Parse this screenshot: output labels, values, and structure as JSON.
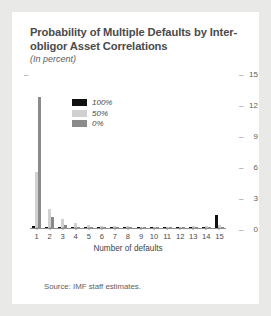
{
  "card": {
    "title": "Probability of Multiple Defaults by Inter-obligor Asset Correlations",
    "subtitle": "(In percent)",
    "source": "Source: IMF staff estimates."
  },
  "legend": {
    "items": [
      {
        "label": "100%",
        "color": "#111111"
      },
      {
        "label": "50%",
        "color": "#d0d0d0"
      },
      {
        "label": "0%",
        "color": "#8a8a8a"
      }
    ]
  },
  "axis": {
    "left_tick_label": "–",
    "y_ticks": [
      "15",
      "12",
      "9",
      "6",
      "3",
      "0"
    ]
  },
  "chart_data": {
    "type": "bar",
    "title": "Probability of Multiple Defaults by Inter-obligor Asset Correlations",
    "subtitle": "(In percent)",
    "xlabel": "Number of defaults",
    "ylabel": "",
    "ylim": [
      0,
      15
    ],
    "yticks": [
      0,
      3,
      6,
      9,
      12,
      15
    ],
    "grid": false,
    "legend_position": "upper-left-inside",
    "categories": [
      1,
      2,
      3,
      4,
      5,
      6,
      7,
      8,
      9,
      10,
      11,
      12,
      13,
      14,
      15
    ],
    "series": [
      {
        "name": "100%",
        "color": "#111111",
        "values": [
          0.15,
          0.12,
          0.1,
          0.08,
          0.08,
          0.07,
          0.07,
          0.07,
          0.07,
          0.07,
          0.08,
          0.08,
          0.1,
          0.12,
          1.3
        ]
      },
      {
        "name": "50%",
        "color": "#d0d0d0",
        "values": [
          5.5,
          1.9,
          0.85,
          0.45,
          0.3,
          0.22,
          0.18,
          0.15,
          0.14,
          0.13,
          0.13,
          0.14,
          0.16,
          0.2,
          0.3
        ]
      },
      {
        "name": "0%",
        "color": "#8a8a8a",
        "values": [
          12.8,
          1.1,
          0.3,
          0.12,
          0.06,
          0.04,
          0.03,
          0.02,
          0.02,
          0.02,
          0.02,
          0.02,
          0.03,
          0.03,
          0.04
        ]
      }
    ]
  }
}
